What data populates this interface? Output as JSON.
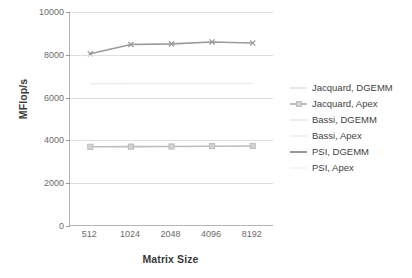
{
  "chart_data": {
    "type": "line",
    "title": "",
    "subtitle": "",
    "xlabel": "Matrix Size",
    "ylabel": "MFlop/s",
    "categories": [
      "512",
      "1024",
      "2048",
      "4096",
      "8192"
    ],
    "ytick_labels": [
      "0",
      "2000",
      "4000",
      "6000",
      "8000",
      "10000"
    ],
    "ylim": [
      0,
      10000
    ],
    "grid": true,
    "legend_position": "right",
    "series": [
      {
        "name": "Jacquard, DGEMM",
        "color": "#e8e8e8",
        "marker": "none",
        "values": [
          null,
          null,
          null,
          null,
          null
        ]
      },
      {
        "name": "Jacquard, Apex",
        "color": "#bdbdbd",
        "marker": "square",
        "values": [
          3700,
          3710,
          3715,
          3730,
          3740
        ]
      },
      {
        "name": "Bassi, DGEMM",
        "color": "#ededed",
        "marker": "none",
        "values": [
          6650,
          6660,
          6660,
          6660,
          6660
        ]
      },
      {
        "name": "Bassi, Apex",
        "color": "#f2f2f2",
        "marker": "none",
        "values": [
          null,
          null,
          null,
          null,
          null
        ]
      },
      {
        "name": "PSI, DGEMM",
        "color": "#9a9a9a",
        "marker": "cross",
        "values": [
          8050,
          8480,
          8510,
          8600,
          8550
        ]
      },
      {
        "name": "PSI, Apex",
        "color": "#f5f5f5",
        "marker": "none",
        "values": [
          null,
          null,
          null,
          null,
          null
        ]
      }
    ]
  },
  "colors": {
    "axis": "#b5b5b5",
    "grid": "#dedede",
    "tick_text": "#6b6b6b",
    "title_text": "#3a3a3a",
    "background": "#ffffff"
  }
}
